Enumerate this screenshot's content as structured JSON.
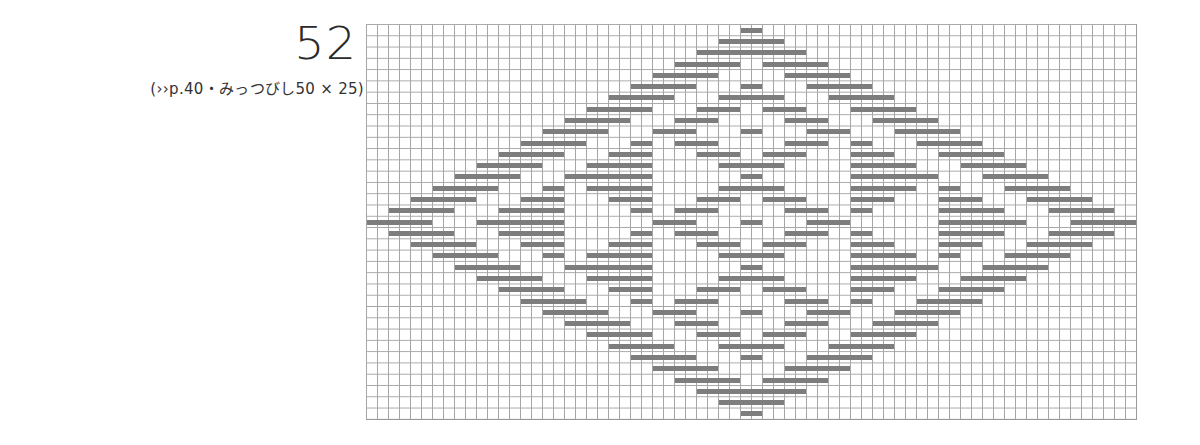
{
  "header": {
    "number": "52",
    "caption": "(››p.40・みっつびし50 × 25)"
  },
  "chart": {
    "columns": 70,
    "rows": 35,
    "grid_color": "#a6a6a6",
    "stitch_color": "#7d7d7d",
    "symmetry": "vertical-mirror (row r == row 34-r)",
    "top_half_rows": [
      [
        [
          34,
          35
        ]
      ],
      [
        [
          32,
          37
        ]
      ],
      [
        [
          30,
          39
        ]
      ],
      [
        [
          28,
          33
        ],
        [
          36,
          41
        ]
      ],
      [
        [
          26,
          31
        ],
        [
          38,
          43
        ]
      ],
      [
        [
          24,
          29
        ],
        [
          34,
          35
        ],
        [
          40,
          45
        ]
      ],
      [
        [
          22,
          27
        ],
        [
          32,
          37
        ],
        [
          42,
          47
        ]
      ],
      [
        [
          20,
          25
        ],
        [
          30,
          33
        ],
        [
          36,
          39
        ],
        [
          44,
          49
        ]
      ],
      [
        [
          18,
          23
        ],
        [
          28,
          31
        ],
        [
          38,
          41
        ],
        [
          46,
          51
        ]
      ],
      [
        [
          16,
          21
        ],
        [
          26,
          29
        ],
        [
          34,
          35
        ],
        [
          40,
          43
        ],
        [
          48,
          53
        ]
      ],
      [
        [
          14,
          19
        ],
        [
          24,
          25
        ],
        [
          28,
          31
        ],
        [
          38,
          41
        ],
        [
          44,
          45
        ],
        [
          50,
          55
        ]
      ],
      [
        [
          12,
          17
        ],
        [
          22,
          25
        ],
        [
          30,
          33
        ],
        [
          36,
          39
        ],
        [
          44,
          47
        ],
        [
          52,
          57
        ]
      ],
      [
        [
          10,
          15
        ],
        [
          20,
          25
        ],
        [
          32,
          37
        ],
        [
          44,
          49
        ],
        [
          54,
          59
        ]
      ],
      [
        [
          8,
          13
        ],
        [
          18,
          25
        ],
        [
          34,
          35
        ],
        [
          44,
          51
        ],
        [
          56,
          61
        ]
      ],
      [
        [
          6,
          11
        ],
        [
          16,
          17
        ],
        [
          20,
          25
        ],
        [
          32,
          37
        ],
        [
          44,
          49
        ],
        [
          52,
          53
        ],
        [
          58,
          63
        ]
      ],
      [
        [
          4,
          9
        ],
        [
          14,
          17
        ],
        [
          22,
          25
        ],
        [
          30,
          33
        ],
        [
          36,
          39
        ],
        [
          44,
          47
        ],
        [
          52,
          55
        ],
        [
          60,
          65
        ]
      ],
      [
        [
          2,
          7
        ],
        [
          12,
          17
        ],
        [
          24,
          25
        ],
        [
          28,
          31
        ],
        [
          38,
          41
        ],
        [
          44,
          45
        ],
        [
          52,
          57
        ],
        [
          62,
          67
        ]
      ],
      [
        [
          0,
          5
        ],
        [
          10,
          17
        ],
        [
          26,
          29
        ],
        [
          34,
          35
        ],
        [
          40,
          43
        ],
        [
          52,
          59
        ],
        [
          64,
          69
        ]
      ]
    ]
  }
}
